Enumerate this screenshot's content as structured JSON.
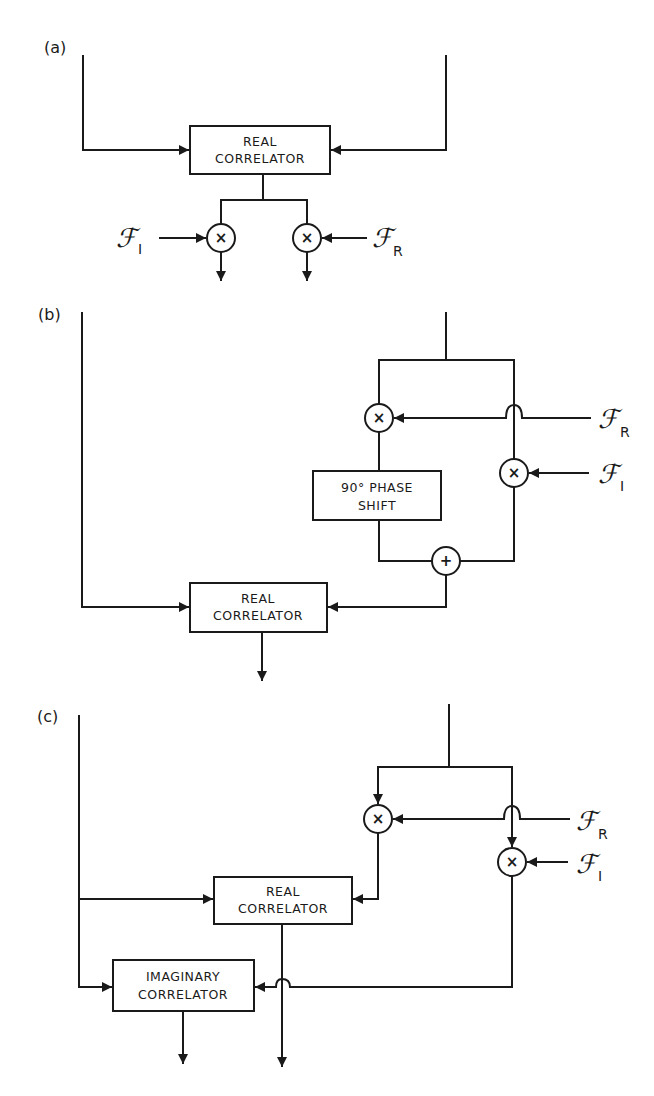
{
  "panels": [
    {
      "label": "(a)",
      "blocks": [
        {
          "id": "real_a",
          "lines": [
            "REAL",
            "CORRELATOR"
          ]
        }
      ],
      "nodes": [
        {
          "id": "mulI_a",
          "op": "×",
          "input": {
            "symbol": "ℱ",
            "sub": "I"
          }
        },
        {
          "id": "mulR_a",
          "op": "×",
          "input": {
            "symbol": "ℱ",
            "sub": "R"
          }
        }
      ]
    },
    {
      "label": "(b)",
      "blocks": [
        {
          "id": "phase_b",
          "lines": [
            "90° PHASE",
            "SHIFT"
          ]
        },
        {
          "id": "real_b",
          "lines": [
            "REAL",
            "CORRELATOR"
          ]
        }
      ],
      "nodes": [
        {
          "id": "mulR_b",
          "op": "×",
          "input": {
            "symbol": "ℱ",
            "sub": "R"
          }
        },
        {
          "id": "mulI_b",
          "op": "×",
          "input": {
            "symbol": "ℱ",
            "sub": "I"
          }
        },
        {
          "id": "sum_b",
          "op": "+"
        }
      ]
    },
    {
      "label": "(c)",
      "blocks": [
        {
          "id": "real_c",
          "lines": [
            "REAL",
            "CORRELATOR"
          ]
        },
        {
          "id": "imag_c",
          "lines": [
            "IMAGINARY",
            "CORRELATOR"
          ]
        }
      ],
      "nodes": [
        {
          "id": "mulR_c",
          "op": "×",
          "input": {
            "symbol": "ℱ",
            "sub": "R"
          }
        },
        {
          "id": "mulI_c",
          "op": "×",
          "input": {
            "symbol": "ℱ",
            "sub": "I"
          }
        }
      ]
    }
  ]
}
